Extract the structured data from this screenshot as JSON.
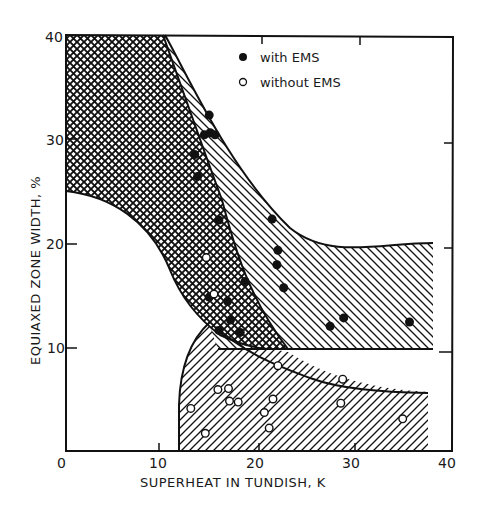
{
  "chart_data": {
    "type": "scatter",
    "title": "",
    "xlabel": "SUPERHEAT IN TUNDISH, K",
    "ylabel": "EQUIAXED ZONE WIDTH, %",
    "xlim": [
      0,
      40
    ],
    "ylim": [
      0,
      40
    ],
    "x_ticks": [
      "0",
      "10",
      "20",
      "30",
      "40"
    ],
    "y_ticks": [
      "10",
      "20",
      "30",
      "40"
    ],
    "grid": false,
    "legend_position": "upper right",
    "legend": [
      {
        "marker": "filled-circle",
        "label": "with EMS"
      },
      {
        "marker": "open-circle",
        "label": "without EMS"
      }
    ],
    "series": [
      {
        "name": "with EMS",
        "marker": "filled",
        "points": [
          [
            14.8,
            32.3
          ],
          [
            14.3,
            30.4
          ],
          [
            14.9,
            30.6
          ],
          [
            15.4,
            30.4
          ],
          [
            13.3,
            28.5
          ],
          [
            13.6,
            26.4
          ],
          [
            15.8,
            22.2
          ],
          [
            21.3,
            22.3
          ],
          [
            21.9,
            19.3
          ],
          [
            21.8,
            17.9
          ],
          [
            18.5,
            16.3
          ],
          [
            22.5,
            15.7
          ],
          [
            14.8,
            14.8
          ],
          [
            16.7,
            14.4
          ],
          [
            17.0,
            12.6
          ],
          [
            15.8,
            11.6
          ],
          [
            18.0,
            11.4
          ],
          [
            27.3,
            12.0
          ],
          [
            28.7,
            12.8
          ],
          [
            35.5,
            12.4
          ]
        ]
      },
      {
        "name": "without EMS",
        "marker": "open",
        "points": [
          [
            14.5,
            18.6
          ],
          [
            15.3,
            15.1
          ],
          [
            12.9,
            4.1
          ],
          [
            14.4,
            1.7
          ],
          [
            15.7,
            5.9
          ],
          [
            16.8,
            6.0
          ],
          [
            16.9,
            4.8
          ],
          [
            17.8,
            4.7
          ],
          [
            21.9,
            8.2
          ],
          [
            21.4,
            5.0
          ],
          [
            20.5,
            3.7
          ],
          [
            21.0,
            2.2
          ],
          [
            28.6,
            6.9
          ],
          [
            28.4,
            4.6
          ],
          [
            34.8,
            3.1
          ]
        ]
      }
    ],
    "regions": [
      {
        "name": "cross-hatched region",
        "pattern": "cross-hatch",
        "description": "upper-left band: from y=25..40 at x=0, bounded right by curve from (10.5,40) down to ~(26,10), lower edge curve from (0,25) through (12,16) to ~(22,10)"
      },
      {
        "name": "upper diagonal-hatched region (with EMS band)",
        "pattern": "diagonal-hatch",
        "description": "between curve from (10.5,40) → (26,21) → (38,20) and lower boundary y=10 line extending to x=38"
      },
      {
        "name": "lower diagonal-hatched region (without EMS band)",
        "pattern": "diagonal-hatch",
        "description": "bounded by vertical x≈12 from y=0 upward curving to (25,10), then curve down to (38,5.7), bottom y=0"
      }
    ],
    "annotations": []
  }
}
